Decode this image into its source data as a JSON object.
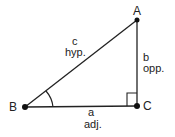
{
  "diagram": {
    "title": "",
    "type": "right-triangle",
    "vertices": [
      {
        "id": "A",
        "label": "A",
        "x": 137,
        "y": 20
      },
      {
        "id": "B",
        "label": "B",
        "x": 25,
        "y": 107
      },
      {
        "id": "C",
        "label": "C",
        "x": 137,
        "y": 106
      }
    ],
    "sides": [
      {
        "name": "c",
        "role": "hyp.",
        "from": "B",
        "to": "A"
      },
      {
        "name": "b",
        "role": "opp.",
        "from": "A",
        "to": "C"
      },
      {
        "name": "a",
        "role": "adj.",
        "from": "B",
        "to": "C"
      }
    ],
    "angle_marker": {
      "vertex": "B",
      "type": "arc"
    },
    "right_angle_marker": {
      "vertex": "C",
      "type": "square"
    },
    "colors": {
      "stroke": "#222222",
      "background": "#ffffff"
    }
  }
}
